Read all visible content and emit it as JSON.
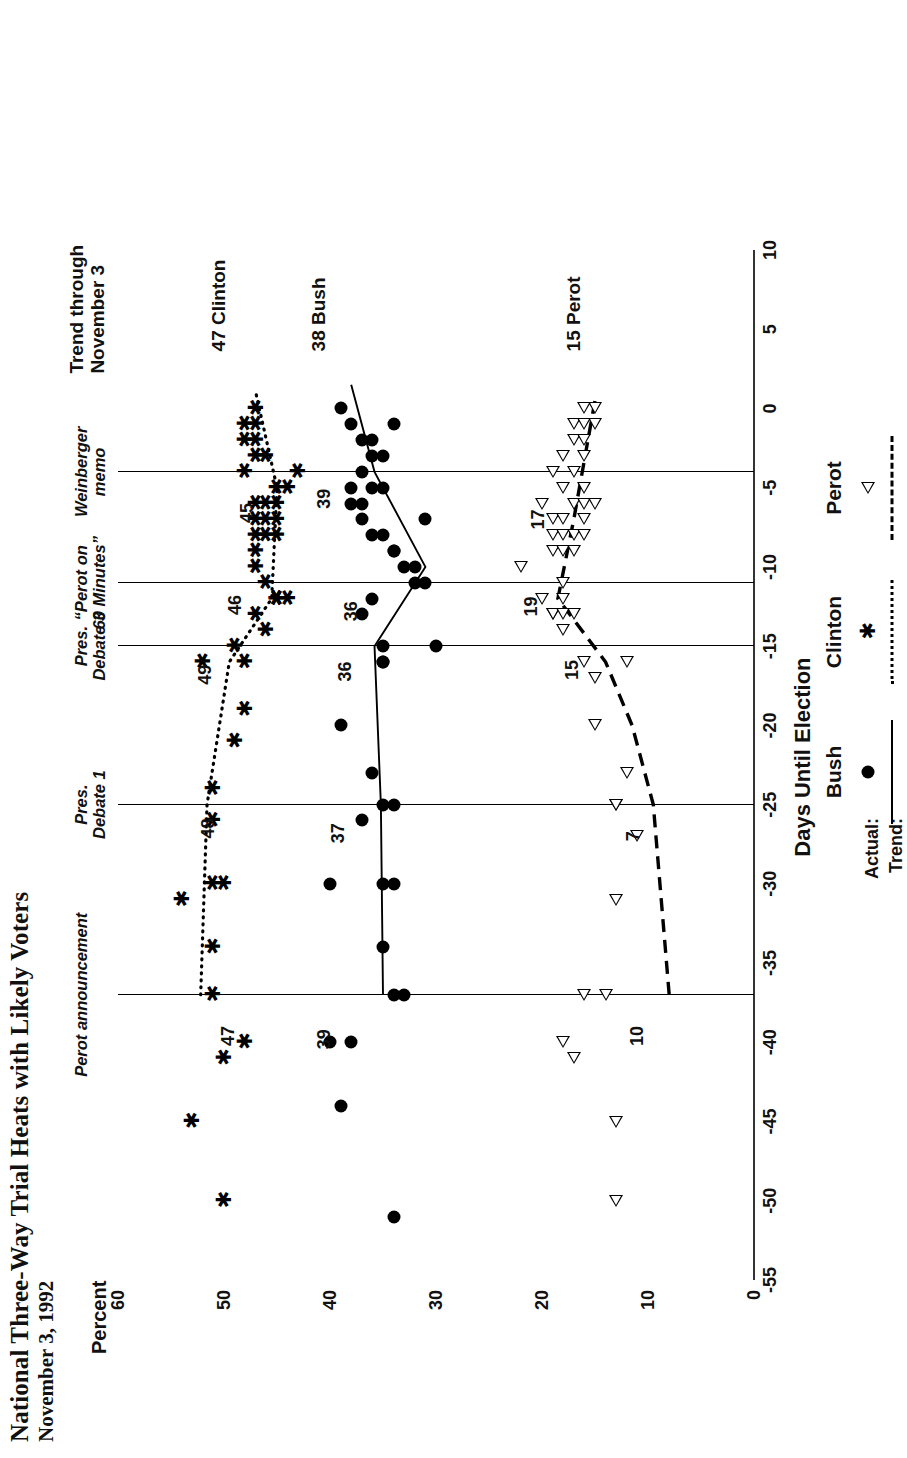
{
  "title": {
    "main": "National Three-Way Trial Heats with Likely Voters",
    "sub": "November 3, 1992"
  },
  "axes": {
    "x_title": "Days Until Election",
    "y_title": "Percent",
    "x_ticks": [
      "-55",
      "-50",
      "-45",
      "-40",
      "-35",
      "-30",
      "-25",
      "-20",
      "-15",
      "-10",
      "-5",
      "0",
      "5",
      "10"
    ],
    "y_ticks": [
      "0",
      "10",
      "20",
      "30",
      "40",
      "50",
      "60"
    ]
  },
  "legend": {
    "row_actual": "Actual:",
    "row_trend": "Trend:",
    "entries": [
      {
        "name": "Bush",
        "marker": "filled-circle-icon",
        "line": "solid"
      },
      {
        "name": "Clinton",
        "marker": "asterisk-icon",
        "line": "dotted"
      },
      {
        "name": "Perot",
        "marker": "open-triangle-icon",
        "line": "dashed"
      }
    ]
  },
  "events": [
    {
      "label": "Perot announcement",
      "day": -37
    },
    {
      "label": "Pres.\nDebate 1",
      "day": -25
    },
    {
      "label": "Pres.\nDebate 3",
      "day": -15
    },
    {
      "label": "“Perot on\n60 Minutes”",
      "day": -11
    },
    {
      "label": "Weinberger\nmemo",
      "day": -4
    }
  ],
  "trend_caption": "Trend through\nNovember 3",
  "series_end_labels": [
    {
      "text": "47  Clinton",
      "day": 3.6,
      "pct": 50.5
    },
    {
      "text": "38  Bush",
      "day": 3.6,
      "pct": 41.0
    },
    {
      "text": "15  Perot",
      "day": 3.6,
      "pct": 17.0
    }
  ],
  "value_annotations": [
    {
      "text": "48",
      "series": "Clinton",
      "day": -26.5,
      "pct": 51.5
    },
    {
      "text": "49",
      "series": "Clinton",
      "day": -16.8,
      "pct": 51.8
    },
    {
      "text": "46",
      "series": "Clinton",
      "day": -12.4,
      "pct": 49.0
    },
    {
      "text": "45",
      "series": "Clinton",
      "day": -6.6,
      "pct": 47.8
    },
    {
      "text": "47",
      "series": "Clinton",
      "day": -39.6,
      "pct": 49.6
    },
    {
      "text": "37",
      "series": "Bush",
      "day": -26.8,
      "pct": 39.2
    },
    {
      "text": "36",
      "series": "Bush",
      "day": -16.6,
      "pct": 38.6
    },
    {
      "text": "36",
      "series": "Bush",
      "day": -12.8,
      "pct": 38.0
    },
    {
      "text": "39",
      "series": "Bush",
      "day": -5.7,
      "pct": 40.6
    },
    {
      "text": "39",
      "series": "Bush",
      "day": -39.8,
      "pct": 40.6
    },
    {
      "text": "7",
      "series": "Perot",
      "day": -27.0,
      "pct": 11.4
    },
    {
      "text": "10",
      "series": "Perot",
      "day": -39.6,
      "pct": 11.0
    },
    {
      "text": "15",
      "series": "Perot",
      "day": -16.5,
      "pct": 17.2
    },
    {
      "text": "19",
      "series": "Perot",
      "day": -12.5,
      "pct": 21.0
    },
    {
      "text": "17",
      "series": "Perot",
      "day": -7.0,
      "pct": 20.4
    }
  ],
  "chart_data": {
    "type": "scatter",
    "title": "National Three-Way Trial Heats with Likely Voters",
    "subtitle": "November 3, 1992",
    "xlabel": "Days Until Election",
    "ylabel": "Percent",
    "xlim": [
      -55,
      10
    ],
    "ylim": [
      0,
      60
    ],
    "grid": false,
    "legend_position": "bottom-right",
    "annotations": [
      "Perot announcement (day -37)",
      "Pres. Debate 1 (day -25)",
      "Pres. Debate 3 (day -15)",
      "“Perot on 60 Minutes” (day -11)",
      "Weinberger memo (day -4)",
      "Trend through November 3"
    ],
    "series": [
      {
        "name": "Bush",
        "marker": "filled-circle",
        "trend": "solid",
        "trend_endpoints": [
          [
            -37,
            35.0
          ],
          [
            -25,
            35.2
          ],
          [
            -15,
            35.8
          ],
          [
            -10,
            31.0
          ],
          [
            -4,
            35.8
          ],
          [
            1.5,
            38.0
          ]
        ],
        "points": [
          [
            -51,
            34
          ],
          [
            -44,
            39
          ],
          [
            -40,
            38
          ],
          [
            -40,
            40
          ],
          [
            -37,
            34
          ],
          [
            -37,
            33
          ],
          [
            -34,
            35
          ],
          [
            -30,
            40
          ],
          [
            -30,
            35
          ],
          [
            -30,
            34
          ],
          [
            -26,
            37
          ],
          [
            -25,
            34
          ],
          [
            -25,
            35
          ],
          [
            -23,
            36
          ],
          [
            -20,
            39
          ],
          [
            -16,
            35
          ],
          [
            -16,
            35
          ],
          [
            -15,
            35
          ],
          [
            -15,
            30
          ],
          [
            -13,
            37
          ],
          [
            -12,
            36
          ],
          [
            -11,
            31
          ],
          [
            -11,
            32
          ],
          [
            -10,
            32
          ],
          [
            -10,
            33
          ],
          [
            -9,
            34
          ],
          [
            -9,
            34
          ],
          [
            -8,
            35
          ],
          [
            -8,
            36
          ],
          [
            -7,
            37
          ],
          [
            -7,
            31
          ],
          [
            -6,
            38
          ],
          [
            -6,
            37
          ],
          [
            -5,
            38
          ],
          [
            -5,
            35
          ],
          [
            -5,
            36
          ],
          [
            -4,
            37
          ],
          [
            -3,
            35
          ],
          [
            -3,
            36
          ],
          [
            -2,
            37
          ],
          [
            -2,
            36
          ],
          [
            -1,
            38
          ],
          [
            -1,
            34
          ],
          [
            0,
            39
          ]
        ]
      },
      {
        "name": "Clinton",
        "marker": "asterisk",
        "trend": "dotted",
        "trend_endpoints": [
          [
            -37,
            52.2
          ],
          [
            -25,
            51.6
          ],
          [
            -16,
            49.5
          ],
          [
            -12,
            45.5
          ],
          [
            -5,
            45.0
          ],
          [
            1.0,
            47.0
          ]
        ],
        "points": [
          [
            -50,
            50
          ],
          [
            -45,
            53
          ],
          [
            -41,
            50
          ],
          [
            -40,
            48
          ],
          [
            -37,
            51
          ],
          [
            -34,
            51
          ],
          [
            -31,
            54
          ],
          [
            -30,
            51
          ],
          [
            -30,
            50
          ],
          [
            -26,
            51
          ],
          [
            -24,
            51
          ],
          [
            -21,
            49
          ],
          [
            -19,
            48
          ],
          [
            -16,
            52
          ],
          [
            -16,
            48
          ],
          [
            -15,
            49
          ],
          [
            -14,
            46
          ],
          [
            -13,
            47
          ],
          [
            -12,
            45
          ],
          [
            -12,
            45
          ],
          [
            -12,
            45
          ],
          [
            -12,
            44
          ],
          [
            -11,
            46
          ],
          [
            -10,
            47
          ],
          [
            -9,
            47
          ],
          [
            -8,
            47
          ],
          [
            -8,
            46
          ],
          [
            -8,
            45
          ],
          [
            -7,
            47
          ],
          [
            -7,
            46
          ],
          [
            -7,
            45
          ],
          [
            -6,
            47
          ],
          [
            -6,
            46
          ],
          [
            -6,
            45
          ],
          [
            -5,
            44
          ],
          [
            -5,
            45
          ],
          [
            -4,
            43
          ],
          [
            -4,
            48
          ],
          [
            -3,
            47
          ],
          [
            -3,
            46
          ],
          [
            -2,
            47
          ],
          [
            -2,
            48
          ],
          [
            -1,
            47
          ],
          [
            -1,
            48
          ],
          [
            0,
            47
          ]
        ]
      },
      {
        "name": "Perot",
        "marker": "open-triangle",
        "trend": "dashed",
        "trend_endpoints": [
          [
            -37,
            8.0
          ],
          [
            -25,
            9.5
          ],
          [
            -20,
            11.5
          ],
          [
            -16,
            14.0
          ],
          [
            -12,
            18.5
          ],
          [
            -7,
            17.0
          ],
          [
            0.5,
            15.0
          ]
        ],
        "points": [
          [
            -50,
            13
          ],
          [
            -45,
            13
          ],
          [
            -41,
            17
          ],
          [
            -40,
            18
          ],
          [
            -37,
            16
          ],
          [
            -37,
            14
          ],
          [
            -31,
            13
          ],
          [
            -27,
            11
          ],
          [
            -25,
            13
          ],
          [
            -25,
            13
          ],
          [
            -23,
            12
          ],
          [
            -20,
            15
          ],
          [
            -17,
            15
          ],
          [
            -16,
            16
          ],
          [
            -16,
            12
          ],
          [
            -14,
            18
          ],
          [
            -13,
            19
          ],
          [
            -13,
            19
          ],
          [
            -13,
            18
          ],
          [
            -13,
            17
          ],
          [
            -12,
            20
          ],
          [
            -12,
            18
          ],
          [
            -11,
            18
          ],
          [
            -10,
            22
          ],
          [
            -9,
            19
          ],
          [
            -9,
            18
          ],
          [
            -9,
            17
          ],
          [
            -8,
            19
          ],
          [
            -8,
            18
          ],
          [
            -8,
            17
          ],
          [
            -8,
            16
          ],
          [
            -7,
            19
          ],
          [
            -7,
            18
          ],
          [
            -7,
            16
          ],
          [
            -6,
            20
          ],
          [
            -6,
            17
          ],
          [
            -6,
            16
          ],
          [
            -6,
            15
          ],
          [
            -5,
            18
          ],
          [
            -5,
            16
          ],
          [
            -4,
            19
          ],
          [
            -4,
            17
          ],
          [
            -3,
            18
          ],
          [
            -3,
            16
          ],
          [
            -2,
            17
          ],
          [
            -2,
            16
          ],
          [
            -1,
            17
          ],
          [
            -1,
            15
          ],
          [
            -1,
            16
          ],
          [
            0,
            15
          ],
          [
            0,
            16
          ]
        ]
      }
    ]
  }
}
